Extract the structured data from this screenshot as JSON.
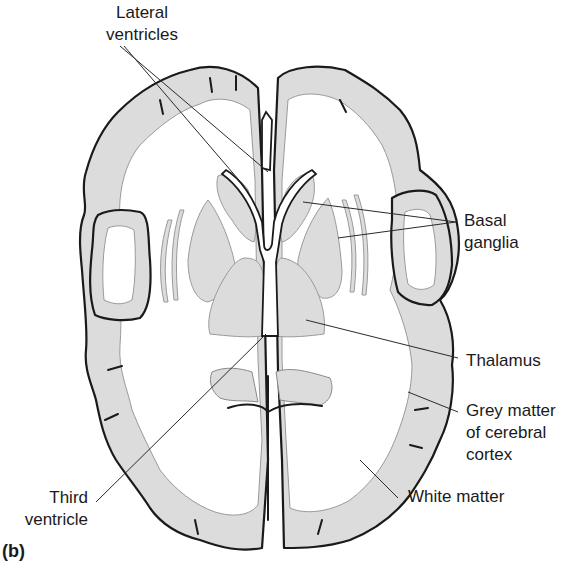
{
  "figure": {
    "panel_label": "(b)",
    "colors": {
      "grey_matter": "#dcdcdc",
      "white_matter": "#ffffff",
      "outline": "#1a1a1a",
      "leader_line": "#2a2a2a"
    }
  },
  "labels": {
    "lateral_ventricles": {
      "line1": "Lateral",
      "line2": "ventricles"
    },
    "basal_ganglia": {
      "line1": "Basal",
      "line2": "ganglia"
    },
    "thalamus": {
      "line1": "Thalamus"
    },
    "grey_matter": {
      "line1": "Grey matter",
      "line2": "of cerebral",
      "line3": "cortex"
    },
    "white_matter": {
      "line1": "White matter"
    },
    "third_ventricle": {
      "line1": "Third",
      "line2": "ventricle"
    }
  }
}
